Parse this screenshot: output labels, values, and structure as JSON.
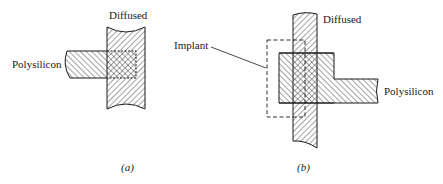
{
  "figure": {
    "panels": [
      {
        "id": "a",
        "caption": "(a)",
        "labels": {
          "diffused": "Diffused",
          "polysilicon": "Polysilicon"
        }
      },
      {
        "id": "b",
        "caption": "(b)",
        "labels": {
          "diffused": "Diffused",
          "polysilicon": "Polysilicon",
          "implant": "Implant"
        }
      }
    ],
    "colors": {
      "ink": "#1a1a1a",
      "background": "#ffffff"
    }
  }
}
